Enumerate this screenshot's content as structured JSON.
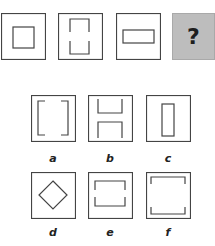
{
  "puzzle": {
    "sequence": [
      {
        "id": "seq-1",
        "shape": "square-in-square"
      },
      {
        "id": "seq-2",
        "shape": "tall-rect-split-vertical-sides"
      },
      {
        "id": "seq-3",
        "shape": "wide-rect"
      },
      {
        "id": "seq-4",
        "shape": "unknown",
        "symbol": "?",
        "background": "#bdbdbd"
      }
    ],
    "options": [
      {
        "label": "a",
        "shape": "brackets-facing-in"
      },
      {
        "label": "b",
        "shape": "h-shape-split-horizontal"
      },
      {
        "label": "c",
        "shape": "tall-narrow-rect"
      },
      {
        "label": "d",
        "shape": "diamond"
      },
      {
        "label": "e",
        "shape": "wide-rect-split-sides"
      },
      {
        "label": "f",
        "shape": "large-square-split-sides"
      }
    ]
  },
  "colors": {
    "stroke": "#444444",
    "question_bg": "#bdbdbd",
    "question_border": "#a9a9a9"
  }
}
